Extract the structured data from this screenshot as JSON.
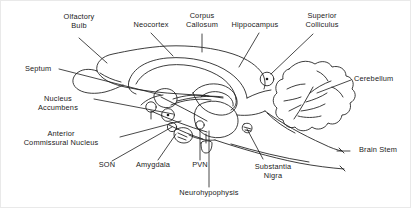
{
  "figure": {
    "type": "anatomical-line-diagram",
    "background_color": "#ffffff",
    "ink_color": "#1a1a1a",
    "border_color": "#e9e9e9",
    "width": 411,
    "height": 208
  },
  "labels": [
    {
      "id": "olfactory-bulb",
      "text": "Olfactory\nBulb",
      "align": "center",
      "x": 78,
      "y": 18
    },
    {
      "id": "neocortex",
      "text": "Neocortex",
      "align": "center",
      "x": 150,
      "y": 22
    },
    {
      "id": "corpus-callosum",
      "text": "Corpus\nCallosum",
      "align": "center",
      "x": 201,
      "y": 14
    },
    {
      "id": "hippocampus",
      "text": "Hippocampus",
      "align": "center",
      "x": 254,
      "y": 22
    },
    {
      "id": "superior-colliculus",
      "text": "Superior\nColliculus",
      "align": "center",
      "x": 321,
      "y": 14
    },
    {
      "id": "cerebellum",
      "text": "Cerebellum",
      "align": "left",
      "x": 353,
      "y": 77
    },
    {
      "id": "septum",
      "text": "Septum",
      "align": "left",
      "x": 24,
      "y": 67
    },
    {
      "id": "nucleus-accumbens",
      "text": "Nucleus\nAccumbens",
      "align": "center",
      "x": 57,
      "y": 97
    },
    {
      "id": "anterior-commissural-nucleus",
      "text": "Anterior\nCommissural Nucleus",
      "align": "center",
      "x": 60,
      "y": 132
    },
    {
      "id": "son",
      "text": "SON",
      "align": "center",
      "x": 106,
      "y": 166
    },
    {
      "id": "amygdala",
      "text": "Amygdala",
      "align": "center",
      "x": 152,
      "y": 166
    },
    {
      "id": "pvn",
      "text": "PVN",
      "align": "center",
      "x": 199,
      "y": 166
    },
    {
      "id": "substantia-nigra",
      "text": "Substantia\nNigra",
      "align": "center",
      "x": 272,
      "y": 165
    },
    {
      "id": "neurohypophysis",
      "text": "Neurohypophysis",
      "align": "center",
      "x": 208,
      "y": 192
    },
    {
      "id": "brain-stem",
      "text": "Brain Stem",
      "align": "left",
      "x": 352,
      "y": 148
    }
  ],
  "leader_lines": [
    {
      "id": "leader-olfactory-bulb",
      "d": "M78,37 L106,62"
    },
    {
      "id": "leader-neocortex",
      "d": "M150,32 L172,55"
    },
    {
      "id": "leader-corpus-callosum",
      "d": "M201,33 L201,51"
    },
    {
      "id": "leader-hippocampus",
      "d": "M258,32 L238,66"
    },
    {
      "id": "leader-superior-colliculus",
      "d": "M312,33 L270,73"
    },
    {
      "id": "leader-cerebellum",
      "d": "M350,79 L316,92"
    },
    {
      "id": "leader-septum",
      "d": "M58,68 L160,94"
    },
    {
      "id": "leader-nucleus-accumbens",
      "d": "M93,98 L172,113"
    },
    {
      "id": "leader-anterior-commissural",
      "d": "M119,136 L180,120"
    },
    {
      "id": "leader-son",
      "d": "M111,160 L171,126"
    },
    {
      "id": "leader-amygdala",
      "d": "M157,159 L175,133"
    },
    {
      "id": "leader-pvn",
      "d": "M199,159 L199,128"
    },
    {
      "id": "leader-substantia-nigra",
      "d": "M262,158 L246,128"
    },
    {
      "id": "leader-neurohypophysis",
      "d": "M208,186 L208,130"
    },
    {
      "id": "leader-brain-stem",
      "d": "M349,150 L336,150"
    }
  ]
}
